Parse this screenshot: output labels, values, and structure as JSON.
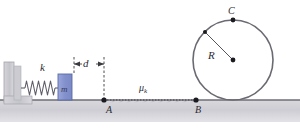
{
  "figure": {
    "background_color": "#ffffff",
    "width": 300,
    "height": 128
  },
  "labels": {
    "spring_constant": "k",
    "block_mass": "m",
    "compression_distance": "d",
    "point_a": "A",
    "point_b": "B",
    "point_c": "C",
    "radius": "R",
    "friction_coefficient_symbol": "μ",
    "friction_coefficient_subscript": "k"
  },
  "colors": {
    "wall_fill": "#c9c9ce",
    "wall_stroke": "#9a9aa2",
    "ground_fill": "#cfcfd4",
    "ground_line": "#6e6e78",
    "block_fill": "#8b9ad4",
    "block_stroke": "#5a6aa8",
    "spring_stroke": "#5e5e68",
    "circle_stroke": "#6a6a72",
    "dot_fill": "#1a1a20",
    "dashed_stroke": "#3a3a42",
    "text_color": "#2b2b33"
  },
  "geometry": {
    "ground_surface_y": 100,
    "ground_base_bottom_y": 122,
    "wall": {
      "x": 10,
      "y": 66,
      "width": 11,
      "height": 34
    },
    "spring": {
      "start_x": 21,
      "end_x": 58,
      "y": 88,
      "coils": 11,
      "amplitude": 7
    },
    "block": {
      "x": 58,
      "y": 74,
      "width": 14,
      "height": 26
    },
    "dim_line_left_x": 74,
    "dim_line_right_x": 104,
    "dim_arrow_y": 64,
    "point_a": {
      "x": 104,
      "y": 100
    },
    "point_b": {
      "x": 196,
      "y": 100
    },
    "point_c": {
      "x": 233,
      "y": 20
    },
    "circle": {
      "cx": 233,
      "cy": 60,
      "r": 40
    },
    "radius_line": {
      "x1": 205,
      "y1": 32,
      "x2": 233,
      "y2": 60
    },
    "rough_segment": {
      "x_start": 104,
      "x_end": 196,
      "y": 100
    }
  }
}
